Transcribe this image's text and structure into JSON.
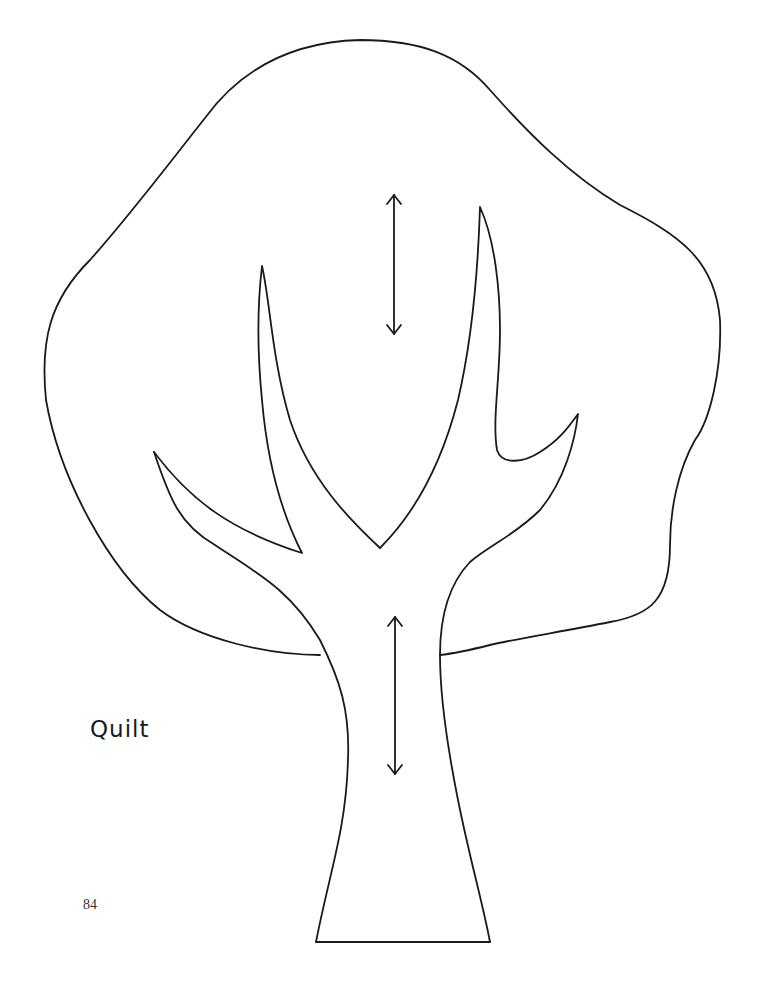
{
  "template": {
    "subject": "tree",
    "label": "Quilt",
    "grain_arrows": 2
  },
  "page": {
    "number": "84"
  },
  "colors": {
    "line": "#1a1a1a",
    "background": "#ffffff"
  }
}
